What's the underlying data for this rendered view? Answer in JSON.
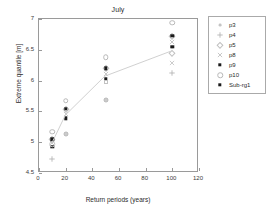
{
  "chart_data": {
    "type": "scatter",
    "title": "July",
    "xlabel": "Return periods (years)",
    "ylabel": "Extreme quantile [m]",
    "xlim": [
      0,
      120
    ],
    "ylim": [
      4.5,
      7
    ],
    "xticks": [
      0,
      20,
      40,
      60,
      80,
      100,
      120
    ],
    "yticks": [
      4.5,
      5,
      5.5,
      6,
      6.5,
      7
    ],
    "xtick_labels": [
      "0",
      "20",
      "40",
      "60",
      "80",
      "100",
      "120"
    ],
    "ytick_labels": [
      "4.5",
      "5",
      "5.5",
      "6",
      "6.5",
      "7"
    ],
    "grid": false,
    "legend_position": "outside-right-top",
    "x": [
      10,
      20,
      50,
      100
    ],
    "series": [
      {
        "name": "p3",
        "marker": "dot-small",
        "color": "#c4c4c4",
        "values": [
          4.93,
          5.39,
          6.03,
          6.55
        ]
      },
      {
        "name": "p4",
        "marker": "plus",
        "color": "#b0b0b0",
        "values": [
          4.72,
          5.13,
          5.69,
          6.13
        ]
      },
      {
        "name": "p5",
        "marker": "diamond",
        "color": "#c0c0c0",
        "values": [
          5.05,
          5.54,
          6.2,
          6.73
        ]
      },
      {
        "name": "p8",
        "marker": "cross",
        "color": "#bcbcbc",
        "values": [
          4.99,
          5.45,
          6.1,
          6.63
        ]
      },
      {
        "name": "p9",
        "marker": "square-filled",
        "color": "#1a1a1a",
        "values": [
          5.05,
          5.54,
          6.2,
          6.73
        ]
      },
      {
        "name": "p10",
        "marker": "open-circle",
        "color": "#b8b8b8",
        "values": [
          5.17,
          5.67,
          6.38,
          6.94
        ]
      },
      {
        "name": "Sub-rg1",
        "marker": "square-filled",
        "color": "#1a1a1a",
        "values": [
          4.93,
          5.39,
          6.03,
          6.55
        ]
      }
    ],
    "trendline": {
      "name": "mean-curve",
      "color": "#cfcfcf",
      "x": [
        10,
        20,
        50,
        100
      ],
      "values": [
        4.97,
        5.42,
        6.06,
        6.47
      ]
    },
    "extra_points": [
      {
        "series": "p10-low",
        "marker": "open-circle",
        "x": 10,
        "y": 4.97
      },
      {
        "series": "p8-mid",
        "marker": "square-open",
        "x": 20,
        "y": 5.13
      },
      {
        "series": "p3-mid",
        "marker": "square-open",
        "x": 50,
        "y": 5.97
      },
      {
        "series": "p4-mid",
        "marker": "square-open",
        "x": 50,
        "y": 5.69
      },
      {
        "series": "p5-hi",
        "marker": "diamond",
        "x": 100,
        "y": 6.45
      },
      {
        "series": "p8-hi",
        "marker": "cross",
        "x": 100,
        "y": 6.28
      }
    ]
  },
  "legend": {
    "items": [
      {
        "label": "p3"
      },
      {
        "label": "p4"
      },
      {
        "label": "p5"
      },
      {
        "label": "p8"
      },
      {
        "label": "p9"
      },
      {
        "label": "p10"
      },
      {
        "label": "Sub-rg1"
      }
    ]
  }
}
